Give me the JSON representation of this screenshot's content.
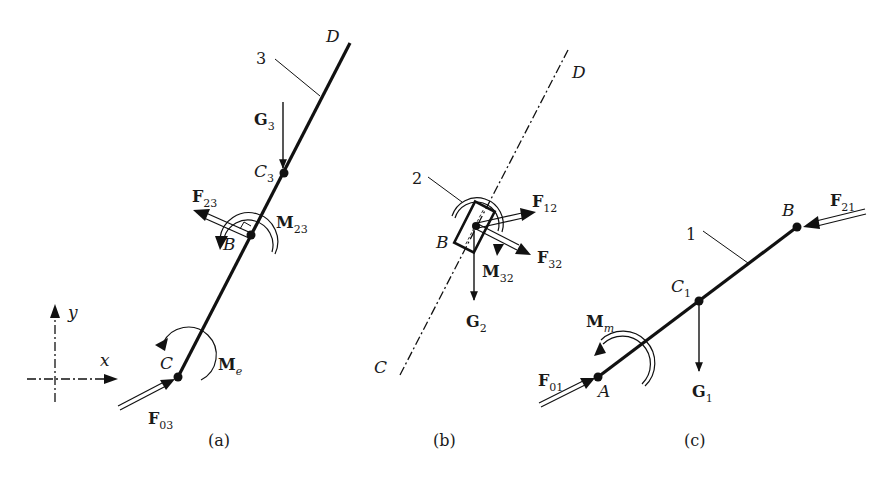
{
  "figure": {
    "panels": [
      {
        "caption": "(a)",
        "link_number": "3",
        "points": {
          "D": "D",
          "C3": "C",
          "C3_sub": "3",
          "B": "B",
          "C": "C"
        },
        "forces": {
          "G3": {
            "main": "G",
            "sub": "3"
          },
          "F23": {
            "main": "F",
            "sub": "23"
          },
          "F03": {
            "main": "F",
            "sub": "03"
          }
        },
        "moments": {
          "M23": {
            "main": "M",
            "sub": "23"
          },
          "Me": {
            "main": "M",
            "sub": "e"
          }
        },
        "axes": {
          "x": "x",
          "y": "y"
        }
      },
      {
        "caption": "(b)",
        "link_number": "2",
        "points": {
          "D": "D",
          "B": "B",
          "C": "C"
        },
        "forces": {
          "F12": {
            "main": "F",
            "sub": "12"
          },
          "F32": {
            "main": "F",
            "sub": "32"
          },
          "G2": {
            "main": "G",
            "sub": "2"
          }
        },
        "moments": {
          "M32": {
            "main": "M",
            "sub": "32"
          }
        }
      },
      {
        "caption": "(c)",
        "link_number": "1",
        "points": {
          "B": "B",
          "C1": "C",
          "C1_sub": "1",
          "A": "A"
        },
        "forces": {
          "F21": {
            "main": "F",
            "sub": "21"
          },
          "G1": {
            "main": "G",
            "sub": "1"
          },
          "F01": {
            "main": "F",
            "sub": "01"
          }
        },
        "moments": {
          "Mm": {
            "main": "M",
            "sub": "m"
          }
        }
      }
    ]
  }
}
